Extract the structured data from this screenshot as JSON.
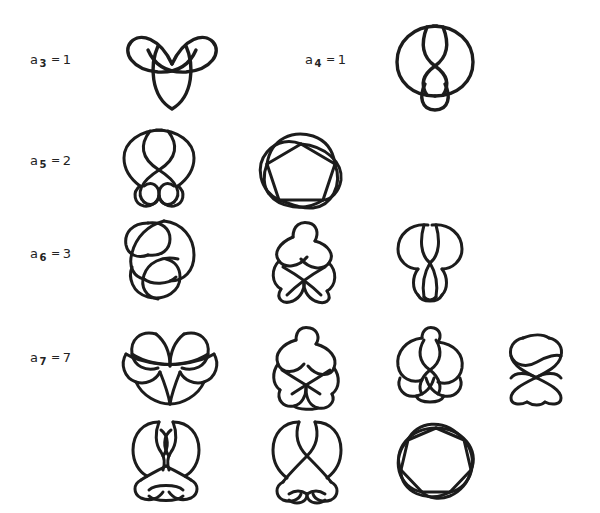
{
  "figure": {
    "kind": "knot-table",
    "background_color": "#ffffff",
    "stroke_color": "#1c1c1c",
    "rows": [
      {
        "id": "row-a3",
        "entries": [
          {
            "label_symbol": "a",
            "label_subscript": "3",
            "label_equals": "=",
            "label_value": "1",
            "label_text": "a3 = 1",
            "knots": [
              "trefoil-3-1"
            ]
          },
          {
            "label_symbol": "a",
            "label_subscript": "4",
            "label_equals": "=",
            "label_value": "1",
            "label_text": "a4 = 1",
            "knots": [
              "figure-eight-4-1"
            ]
          }
        ]
      },
      {
        "id": "row-a5",
        "entries": [
          {
            "label_symbol": "a",
            "label_subscript": "5",
            "label_equals": "=",
            "label_value": "2",
            "label_text": "a5 = 2",
            "knots": [
              "knot-5-1",
              "knot-5-2"
            ]
          }
        ]
      },
      {
        "id": "row-a6",
        "entries": [
          {
            "label_symbol": "a",
            "label_subscript": "6",
            "label_equals": "=",
            "label_value": "3",
            "label_text": "a6 = 3",
            "knots": [
              "knot-6-1",
              "knot-6-2",
              "knot-6-3"
            ]
          }
        ]
      },
      {
        "id": "row-a7",
        "entries": [
          {
            "label_symbol": "a",
            "label_subscript": "7",
            "label_equals": "=",
            "label_value": "7",
            "label_text": "a7 = 7",
            "knots": [
              "knot-7-1",
              "knot-7-2",
              "knot-7-3",
              "knot-7-4",
              "knot-7-5",
              "knot-7-6",
              "knot-7-7"
            ]
          }
        ]
      }
    ]
  },
  "labels": {
    "a3": {
      "symbol": "a",
      "sub": "3",
      "eq": "=",
      "value": "1"
    },
    "a4": {
      "symbol": "a",
      "sub": "4",
      "eq": "=",
      "value": "1"
    },
    "a5": {
      "symbol": "a",
      "sub": "5",
      "eq": "=",
      "value": "2"
    },
    "a6": {
      "symbol": "a",
      "sub": "6",
      "eq": "=",
      "value": "3"
    },
    "a7": {
      "symbol": "a",
      "sub": "7",
      "eq": "=",
      "value": "7"
    }
  }
}
